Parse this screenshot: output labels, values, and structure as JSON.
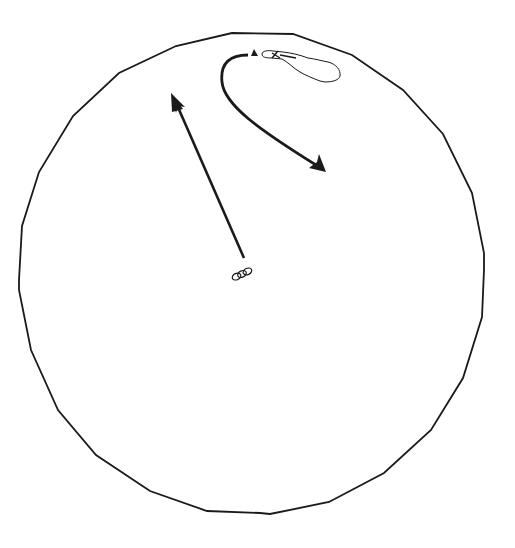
{
  "diagram": {
    "type": "circular-boundary-map",
    "background": "#ffffff",
    "stroke_color": "#1a1a1a",
    "boundary": {
      "shape": "polygon-circle",
      "points": "232,33 293,34 352,55 403,90 443,134 472,193 484,253 484,270 482,317 463,378 431,430 384,473 329,502 270,514 260,513 207,511 150,491 96,455 58,410 31,350 19,290 19,280 22,226 39,172 73,116 119,73 176,46"
    },
    "elements": [
      {
        "id": "straight-arrow",
        "label": "arrow from origin heading north-northwest",
        "from": [
          244,
          258
        ],
        "to": [
          171,
          93
        ]
      },
      {
        "id": "curved-arrow",
        "label": "curved arrow from north marker heading southeast",
        "path": "M 248 55 C 225 55, 212 70, 225 100 C 240 125, 285 145, 325 172"
      },
      {
        "id": "triangle-marker",
        "label": "triangle marker",
        "at": [
          254,
          53
        ]
      },
      {
        "id": "lake-outline",
        "label": "elongated lake outline"
      },
      {
        "id": "origin-figure",
        "label": "small chain figure at origin",
        "at": [
          242,
          274
        ]
      }
    ]
  }
}
